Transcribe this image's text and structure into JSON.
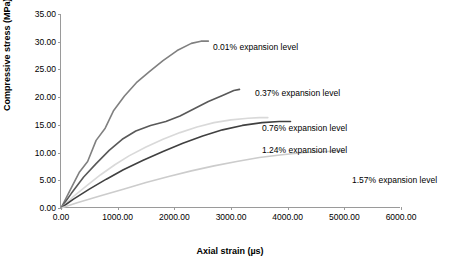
{
  "chart_data": {
    "type": "line",
    "title": "",
    "xlabel": "Axial strain (µs)",
    "ylabel": "Compressive stress (MPa)",
    "xlim": [
      0,
      6000
    ],
    "ylim": [
      0,
      35
    ],
    "xticks": [
      "0.00",
      "1000.00",
      "2000.00",
      "3000.00",
      "4000.00",
      "5000.00",
      "6000.00"
    ],
    "xtick_values": [
      0,
      1000,
      2000,
      3000,
      4000,
      5000,
      6000
    ],
    "yticks": [
      "0.00",
      "5.00",
      "10.00",
      "15.00",
      "20.00",
      "25.00",
      "30.00",
      "35.00"
    ],
    "ytick_values": [
      0,
      5,
      10,
      15,
      20,
      25,
      30,
      35
    ],
    "grid": false,
    "legend_position": "inline-annotations",
    "series": [
      {
        "name": "0.01% expansion level",
        "color": "#808080",
        "points": [
          [
            0,
            0
          ],
          [
            150,
            3.0
          ],
          [
            320,
            6.4
          ],
          [
            470,
            8.4
          ],
          [
            620,
            12.2
          ],
          [
            780,
            14.4
          ],
          [
            930,
            17.6
          ],
          [
            1120,
            20.2
          ],
          [
            1330,
            22.6
          ],
          [
            1560,
            24.6
          ],
          [
            1800,
            26.6
          ],
          [
            2050,
            28.4
          ],
          [
            2300,
            29.7
          ],
          [
            2470,
            30.1
          ],
          [
            2600,
            30.1
          ]
        ]
      },
      {
        "name": "0.37% expansion level",
        "color": "#595959",
        "points": [
          [
            0,
            0
          ],
          [
            180,
            2.6
          ],
          [
            400,
            5.6
          ],
          [
            620,
            8.0
          ],
          [
            850,
            10.4
          ],
          [
            1080,
            12.4
          ],
          [
            1320,
            13.9
          ],
          [
            1580,
            14.9
          ],
          [
            1850,
            15.6
          ],
          [
            2100,
            16.6
          ],
          [
            2350,
            17.9
          ],
          [
            2600,
            19.2
          ],
          [
            2850,
            20.3
          ],
          [
            3050,
            21.2
          ],
          [
            3150,
            21.4
          ]
        ]
      },
      {
        "name": "0.76% expansion level",
        "color": "#d9d9d9",
        "points": [
          [
            0,
            0
          ],
          [
            200,
            1.9
          ],
          [
            450,
            4.0
          ],
          [
            700,
            6.0
          ],
          [
            950,
            7.8
          ],
          [
            1200,
            9.4
          ],
          [
            1500,
            11.0
          ],
          [
            1800,
            12.4
          ],
          [
            2100,
            13.6
          ],
          [
            2400,
            14.6
          ],
          [
            2700,
            15.4
          ],
          [
            3000,
            15.9
          ],
          [
            3300,
            16.2
          ],
          [
            3500,
            16.3
          ],
          [
            3650,
            16.3
          ]
        ]
      },
      {
        "name": "1.24% expansion level",
        "color": "#404040",
        "points": [
          [
            0,
            0
          ],
          [
            220,
            1.6
          ],
          [
            500,
            3.4
          ],
          [
            800,
            5.2
          ],
          [
            1100,
            6.9
          ],
          [
            1450,
            8.6
          ],
          [
            1800,
            10.2
          ],
          [
            2150,
            11.7
          ],
          [
            2500,
            13.0
          ],
          [
            2850,
            14.1
          ],
          [
            3200,
            14.9
          ],
          [
            3550,
            15.4
          ],
          [
            3850,
            15.6
          ],
          [
            4050,
            15.6
          ]
        ]
      },
      {
        "name": "1.57% expansion level",
        "color": "#cccccc",
        "points": [
          [
            0,
            0
          ],
          [
            300,
            1.0
          ],
          [
            700,
            2.2
          ],
          [
            1100,
            3.4
          ],
          [
            1500,
            4.6
          ],
          [
            1900,
            5.7
          ],
          [
            2300,
            6.7
          ],
          [
            2700,
            7.6
          ],
          [
            3100,
            8.4
          ],
          [
            3500,
            9.1
          ],
          [
            3900,
            9.6
          ],
          [
            4300,
            10.0
          ],
          [
            4700,
            10.2
          ],
          [
            5000,
            10.3
          ]
        ]
      }
    ],
    "annotations": [
      {
        "text": "0.01% expansion level",
        "x": 213,
        "y": 42
      },
      {
        "text": "0.37% expansion level",
        "x": 255,
        "y": 88
      },
      {
        "text": "0.76% expansion level",
        "x": 262,
        "y": 123
      },
      {
        "text": "1.24% expansion level",
        "x": 262,
        "y": 145
      },
      {
        "text": "1.57% expansion level",
        "x": 352,
        "y": 175
      }
    ]
  }
}
